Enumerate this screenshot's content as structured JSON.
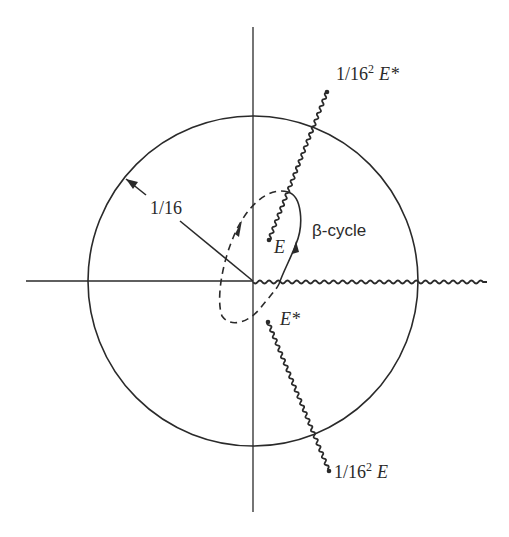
{
  "diagram": {
    "type": "complex-plane branch-cut diagram",
    "colors": {
      "ink": "#2a2a2a",
      "background": "#ffffff"
    },
    "geometry": {
      "origin": [
        253,
        281
      ],
      "circle_radius": 165
    },
    "labels": {
      "radius": "1/16",
      "top_cut_end": "1/16",
      "top_cut_end_sup": "2",
      "top_cut_end_var": "E*",
      "bottom_cut_end": "1/16",
      "bottom_cut_end_sup": "2",
      "bottom_cut_end_var": "E",
      "point_e": "E",
      "point_e_star": "E*",
      "cycle": "β-cycle"
    },
    "elements": [
      {
        "id": "circle",
        "desc": "circle of radius 1/16 centered at origin"
      },
      {
        "id": "real-axis",
        "desc": "horizontal axis"
      },
      {
        "id": "imag-axis",
        "desc": "vertical axis"
      },
      {
        "id": "branch-cut-real",
        "desc": "wavy cut along positive real axis"
      },
      {
        "id": "branch-cut-upper",
        "desc": "wavy cut from E to 1/16^2 E*"
      },
      {
        "id": "branch-cut-lower",
        "desc": "wavy cut from E* to 1/16^2 E"
      },
      {
        "id": "beta-cycle",
        "desc": "closed loop, solid on one sheet, dashed on the other, with direction arrows"
      },
      {
        "id": "radius-marker",
        "desc": "radius line with arrow to circle labelled 1/16"
      }
    ]
  }
}
